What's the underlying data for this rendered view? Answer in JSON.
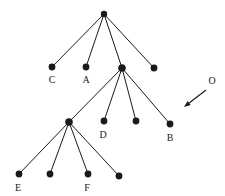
{
  "diagram": {
    "type": "tree-graph",
    "title": "",
    "colors": {
      "node": "#1a1a1a",
      "edge": "#1a1a1a",
      "label": "#1a1a1a",
      "background": "#ffffff"
    },
    "nodes": [
      {
        "id": "root",
        "x": 104,
        "y": 14,
        "r": 3.2,
        "label": "",
        "label_x": 104,
        "label_y": 0
      },
      {
        "id": "n_c",
        "x": 52,
        "y": 67,
        "r": 3.4,
        "label": "C",
        "label_x": 52,
        "label_y": 83
      },
      {
        "id": "n_a",
        "x": 86,
        "y": 67,
        "r": 3.4,
        "label": "A",
        "label_x": 86,
        "label_y": 83
      },
      {
        "id": "n_mid",
        "x": 122,
        "y": 68,
        "r": 3.8,
        "label": "",
        "label_x": 122,
        "label_y": 0
      },
      {
        "id": "n_r2",
        "x": 154,
        "y": 68,
        "r": 3.4,
        "label": "",
        "label_x": 154,
        "label_y": 0
      },
      {
        "id": "n_left3",
        "x": 69,
        "y": 122,
        "r": 3.8,
        "label": "",
        "label_x": 69,
        "label_y": 0
      },
      {
        "id": "n_d",
        "x": 104,
        "y": 121,
        "r": 3.4,
        "label": "D",
        "label_x": 103,
        "label_y": 138
      },
      {
        "id": "n_u3",
        "x": 136,
        "y": 121,
        "r": 3.4,
        "label": "",
        "label_x": 136,
        "label_y": 0
      },
      {
        "id": "n_b",
        "x": 170,
        "y": 124,
        "r": 3.4,
        "label": "B",
        "label_x": 170,
        "label_y": 141
      },
      {
        "id": "n_e",
        "x": 19,
        "y": 174,
        "r": 3.4,
        "label": "E",
        "label_x": 18,
        "label_y": 191
      },
      {
        "id": "n_b2",
        "x": 50,
        "y": 174,
        "r": 3.4,
        "label": "",
        "label_x": 50,
        "label_y": 0
      },
      {
        "id": "n_f",
        "x": 88,
        "y": 174,
        "r": 3.4,
        "label": "F",
        "label_x": 87,
        "label_y": 191
      },
      {
        "id": "n_b4",
        "x": 119,
        "y": 176,
        "r": 3.4,
        "label": "",
        "label_x": 119,
        "label_y": 0
      }
    ],
    "edges": [
      {
        "from": "root",
        "to": "n_c"
      },
      {
        "from": "root",
        "to": "n_a"
      },
      {
        "from": "root",
        "to": "n_mid"
      },
      {
        "from": "root",
        "to": "n_r2"
      },
      {
        "from": "n_mid",
        "to": "n_left3"
      },
      {
        "from": "n_mid",
        "to": "n_d"
      },
      {
        "from": "n_mid",
        "to": "n_u3"
      },
      {
        "from": "n_mid",
        "to": "n_b"
      },
      {
        "from": "n_left3",
        "to": "n_e"
      },
      {
        "from": "n_left3",
        "to": "n_b2"
      },
      {
        "from": "n_left3",
        "to": "n_f"
      },
      {
        "from": "n_left3",
        "to": "n_b4"
      }
    ],
    "annotation": {
      "label": "O",
      "label_x": 212,
      "label_y": 84,
      "arrow_start_x": 206,
      "arrow_start_y": 90,
      "arrow_end_x": 184,
      "arrow_end_y": 107
    }
  }
}
